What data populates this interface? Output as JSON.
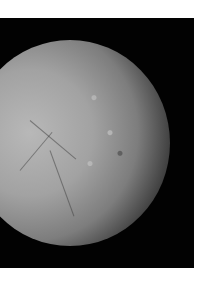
{
  "image": {
    "subject": "icy moon surface with cratered and fractured terrain against black space",
    "colors": {
      "background": "#ffffff",
      "space": "#020202",
      "surface_light": "#b8b8b8",
      "surface_dark": "#3a3a3a"
    }
  }
}
